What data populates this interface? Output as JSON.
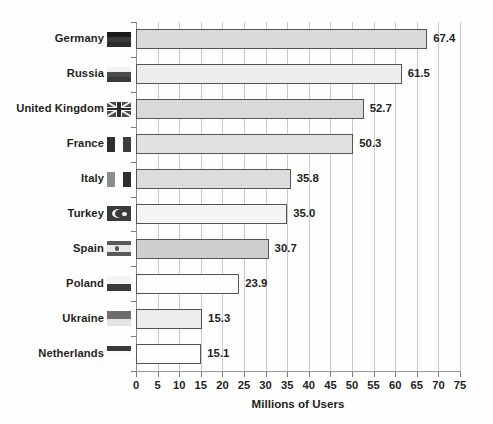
{
  "chart_data": {
    "type": "bar",
    "orientation": "horizontal",
    "title": "",
    "xlabel": "Millions of Users",
    "ylabel": "",
    "xlim": [
      0,
      75
    ],
    "xticks": [
      0,
      5,
      10,
      15,
      20,
      25,
      30,
      35,
      40,
      45,
      50,
      55,
      60,
      65,
      70,
      75
    ],
    "grid": "vertical",
    "legend": "none",
    "categories": [
      "Germany",
      "Russia",
      "United Kingdom",
      "France",
      "Italy",
      "Turkey",
      "Spain",
      "Poland",
      "Ukraine",
      "Netherlands"
    ],
    "values": [
      67.4,
      61.5,
      52.7,
      50.3,
      35.8,
      35.0,
      30.7,
      23.9,
      15.3,
      15.1
    ],
    "value_labels": [
      "67.4",
      "61.5",
      "52.7",
      "50.3",
      "35.8",
      "35.0",
      "30.7",
      "23.9",
      "15.3",
      "15.1"
    ],
    "bars": [
      {
        "category": "Germany",
        "value": 67.4,
        "label": "67.4",
        "flag": "de-flag-icon",
        "fill": "#d9d9d9"
      },
      {
        "category": "Russia",
        "value": 61.5,
        "label": "61.5",
        "flag": "ru-flag-icon",
        "fill": "#ededed"
      },
      {
        "category": "United Kingdom",
        "value": 52.7,
        "label": "52.7",
        "flag": "gb-flag-icon",
        "fill": "#d9d9d9"
      },
      {
        "category": "France",
        "value": 50.3,
        "label": "50.3",
        "flag": "fr-flag-icon",
        "fill": "#e2e2e2"
      },
      {
        "category": "Italy",
        "value": 35.8,
        "label": "35.8",
        "flag": "it-flag-icon",
        "fill": "#dcdcdc"
      },
      {
        "category": "Turkey",
        "value": 35.0,
        "label": "35.0",
        "flag": "tr-flag-icon",
        "fill": "#f4f4f4"
      },
      {
        "category": "Spain",
        "value": 30.7,
        "label": "30.7",
        "flag": "es-flag-icon",
        "fill": "#cfcfcf"
      },
      {
        "category": "Poland",
        "value": 23.9,
        "label": "23.9",
        "flag": "pl-flag-icon",
        "fill": "#fdfdfd"
      },
      {
        "category": "Ukraine",
        "value": 15.3,
        "label": "15.3",
        "flag": "ua-flag-icon",
        "fill": "#ececec"
      },
      {
        "category": "Netherlands",
        "value": 15.1,
        "label": "15.1",
        "flag": "nl-flag-icon",
        "fill": "#fdfdfd"
      }
    ],
    "colors": {
      "background": "#fefefe",
      "bar_border": "#555555",
      "gridline": "#c9c9c9",
      "axis": "#8f8f8f",
      "text": "#231f20"
    }
  }
}
